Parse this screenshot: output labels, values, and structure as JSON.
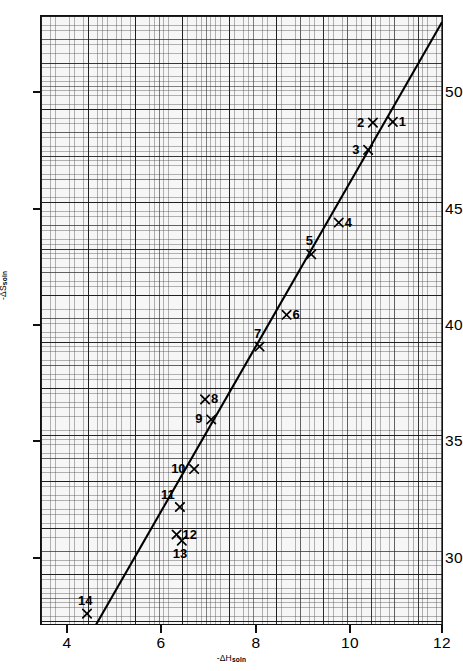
{
  "chart_data": {
    "type": "scatter",
    "title": "",
    "subtitle": "",
    "xlabel": "-ΔH",
    "xlabel_sub": "soln",
    "ylabel": "-ΔS",
    "ylabel_sub": "soln",
    "xlim": [
      3.5,
      12.0
    ],
    "ylim": [
      28.2,
      52.8
    ],
    "xticks": [
      4,
      6,
      8,
      10,
      12
    ],
    "xtick_labels": [
      "4",
      "6",
      "8",
      "10",
      "12"
    ],
    "yticks": [
      30,
      35,
      40,
      45,
      50
    ],
    "ytick_labels": [
      "30",
      "35",
      "40",
      "45",
      "50"
    ],
    "grid": "graph-paper (fine 0.1 unit, medium 0.5 unit, heavy 1.0 unit)",
    "legend": "none",
    "marker": "x",
    "series": [
      {
        "name": "solutes",
        "points": [
          {
            "label": "1",
            "x": 10.92,
            "y": 48.53,
            "label_pos": "right"
          },
          {
            "label": "2",
            "x": 10.5,
            "y": 48.5,
            "label_pos": "left"
          },
          {
            "label": "3",
            "x": 10.4,
            "y": 47.4,
            "label_pos": "left"
          },
          {
            "label": "4",
            "x": 9.78,
            "y": 44.47,
            "label_pos": "right"
          },
          {
            "label": "5",
            "x": 9.2,
            "y": 43.19,
            "label_pos": "above"
          },
          {
            "label": "6",
            "x": 8.68,
            "y": 40.75,
            "label_pos": "right"
          },
          {
            "label": "7",
            "x": 8.11,
            "y": 39.47,
            "label_pos": "above"
          },
          {
            "label": "8",
            "x": 6.96,
            "y": 37.34,
            "label_pos": "right"
          },
          {
            "label": "9",
            "x": 7.09,
            "y": 36.53,
            "label_pos": "left"
          },
          {
            "label": "10",
            "x": 6.73,
            "y": 34.53,
            "label_pos": "left"
          },
          {
            "label": "11",
            "x": 6.43,
            "y": 33.0,
            "label_pos": "above-left"
          },
          {
            "label": "12",
            "x": 6.36,
            "y": 31.89,
            "label_pos": "right"
          },
          {
            "label": "13",
            "x": 6.47,
            "y": 31.64,
            "label_pos": "below"
          },
          {
            "label": "14",
            "x": 4.47,
            "y": 28.7,
            "label_pos": "above"
          }
        ]
      }
    ],
    "fit_line": {
      "name": "best-fit line",
      "x_start": 4.66,
      "y_start": 28.25,
      "x_end": 11.96,
      "y_end": 52.56,
      "slope": 3.33,
      "intercept": 12.73
    }
  }
}
